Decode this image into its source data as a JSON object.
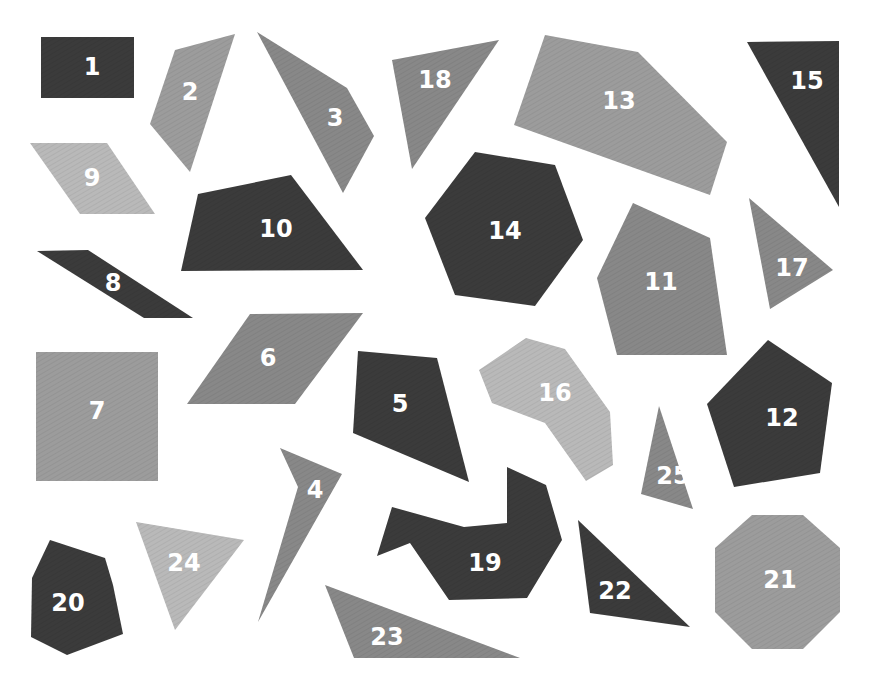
{
  "colors": {
    "dark": "#3b3b3b",
    "medium": "#888888",
    "mediumLight": "#9c9c9c",
    "light": "#b9b9b9",
    "label": "#ffffff",
    "background": "#ffffff"
  },
  "shapes": [
    {
      "id": "1",
      "color": "dark",
      "points": "41,37 134,37 134,98 41,98",
      "label_pos": [
        92,
        67
      ]
    },
    {
      "id": "2",
      "color": "mediumLight",
      "points": "175,50 235,34 190,172 150,124",
      "label_pos": [
        190,
        92
      ]
    },
    {
      "id": "3",
      "color": "medium",
      "points": "257,32 347,88 374,136 343,193",
      "label_pos": [
        335,
        118
      ]
    },
    {
      "id": "4",
      "color": "medium",
      "points": "280,448 342,474 258,622 298,487",
      "label_pos": [
        315,
        490
      ]
    },
    {
      "id": "5",
      "color": "dark",
      "points": "358,351 437,358 469,482 353,433",
      "label_pos": [
        400,
        404
      ]
    },
    {
      "id": "6",
      "color": "medium",
      "points": "250,314 363,313 295,404 187,404",
      "label_pos": [
        268,
        358
      ]
    },
    {
      "id": "7",
      "color": "mediumLight",
      "points": "36,352 158,352 158,481 36,481",
      "label_pos": [
        97,
        411
      ]
    },
    {
      "id": "8",
      "color": "dark",
      "points": "37,251 88,250 193,318 144,318",
      "label_pos": [
        113,
        283
      ]
    },
    {
      "id": "9",
      "color": "light",
      "points": "30,143 107,143 155,214 80,214",
      "label_pos": [
        92,
        178
      ]
    },
    {
      "id": "10",
      "color": "dark",
      "points": "198,194 291,175 363,270 181,271",
      "label_pos": [
        276,
        229
      ]
    },
    {
      "id": "11",
      "color": "medium",
      "points": "633,203 710,238 727,355 617,355 597,278",
      "label_pos": [
        661,
        282
      ]
    },
    {
      "id": "12",
      "color": "dark",
      "points": "768,340 832,383 820,473 734,487 707,404",
      "label_pos": [
        782,
        418
      ]
    },
    {
      "id": "13",
      "color": "mediumLight",
      "points": "545,35 638,52 727,142 710,195 514,125",
      "label_pos": [
        619,
        101
      ]
    },
    {
      "id": "14",
      "color": "dark",
      "points": "475,152 555,165 583,240 535,306 455,295 425,218",
      "label_pos": [
        505,
        231
      ]
    },
    {
      "id": "15",
      "color": "dark",
      "points": "747,42 839,41 839,207",
      "label_pos": [
        807,
        81
      ]
    },
    {
      "id": "16",
      "color": "light",
      "points": "526,338 565,349 610,412 613,465 586,481 545,423 492,403 479,370",
      "label_pos": [
        555,
        393
      ]
    },
    {
      "id": "17",
      "color": "medium",
      "points": "749,198 833,270 770,309",
      "label_pos": [
        792,
        268
      ]
    },
    {
      "id": "18",
      "color": "medium",
      "points": "392,60 499,40 412,169",
      "label_pos": [
        435,
        80
      ]
    },
    {
      "id": "19",
      "color": "dark",
      "points": "392,507 464,527 507,523 507,467 546,485 562,540 527,598 449,600 410,543 377,556",
      "label_pos": [
        485,
        563
      ]
    },
    {
      "id": "20",
      "color": "dark",
      "points": "50,540 105,558 113,585 123,634 67,655 31,637 32,578",
      "label_pos": [
        68,
        603
      ]
    },
    {
      "id": "21",
      "color": "mediumLight",
      "points": "752,515 803,515 840,548 840,612 803,649 752,649 715,612 715,548",
      "label_pos": [
        780,
        580
      ]
    },
    {
      "id": "22",
      "color": "dark",
      "points": "578,520 690,627 590,613",
      "label_pos": [
        615,
        591
      ]
    },
    {
      "id": "23",
      "color": "medium",
      "points": "325,585 520,658 354,658",
      "label_pos": [
        387,
        637
      ]
    },
    {
      "id": "24",
      "color": "light",
      "points": "136,522 244,540 175,630",
      "label_pos": [
        184,
        563
      ]
    },
    {
      "id": "25",
      "color": "medium",
      "points": "659,406 693,509 641,494",
      "label_pos": [
        673,
        476
      ]
    }
  ]
}
